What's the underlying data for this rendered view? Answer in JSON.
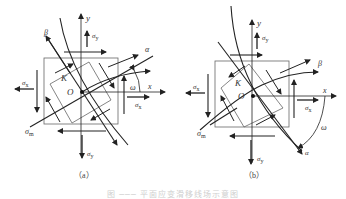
{
  "panels": [
    {
      "id": "a",
      "caption": "（a）",
      "labels": {
        "y": "y",
        "x": "x",
        "alpha": "α",
        "beta": "β",
        "omega": "ω",
        "K": "K",
        "O": "O",
        "sigma_y_top": "σ",
        "sigma_y_top_sub": "y",
        "sigma_x_left": "σ",
        "sigma_x_left_sub": "x",
        "sigma_x_right": "σ",
        "sigma_x_right_sub": "x",
        "sigma_m": "σ",
        "sigma_m_sub": "m",
        "sigma_y_bottom": "σ",
        "sigma_y_bottom_sub": "y"
      }
    },
    {
      "id": "b",
      "caption": "（b）",
      "labels": {
        "y": "y",
        "x": "x",
        "alpha": "α",
        "beta": "β",
        "omega": "ω",
        "K": "K",
        "O": "O",
        "sigma_y_top": "σ",
        "sigma_y_top_sub": "y",
        "sigma_x_left": "σ",
        "sigma_x_left_sub": "x",
        "sigma_x_right": "σ",
        "sigma_x_right_sub": "x",
        "sigma_m": "σ",
        "sigma_m_sub": "m",
        "sigma_y_bottom": "σ",
        "sigma_y_bottom_sub": "y"
      }
    }
  ],
  "figure_caption": "图 ─── 平面应变滑移线场示意图"
}
